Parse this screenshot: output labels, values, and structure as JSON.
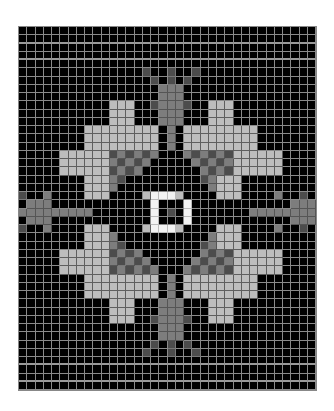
{
  "chart_data": {
    "type": "heatmap",
    "title": "",
    "columns": 36,
    "rows": 44,
    "legend": {
      ".": {
        "name": "black",
        "color": "#000000"
      },
      "L": {
        "name": "light gray",
        "color": "#bdbdbd"
      },
      "M": {
        "name": "mid gray",
        "color": "#7d7d7d"
      },
      "D": {
        "name": "dark gray",
        "color": "#4c4c4c"
      },
      "W": {
        "name": "white",
        "color": "#f2f2f2"
      }
    },
    "dashed_rows": [
      1,
      3,
      40,
      42
    ],
    "grid": [
      "....................................",
      "....................................",
      "....................................",
      "....................................",
      "....................................",
      "...............D..D..D..............",
      "................D.D.D...............",
      ".................MMM................",
      ".................MMM................",
      "...........LLL..DMMMD..LLL..........",
      "...........LLL...MMM...LLL..........",
      "...........LLL...MMM...LLL..........",
      "........LLLLLLLLL.M.LLLLLLLLL.......",
      "........LLLLLLLLL.M.LLLLLLLLL.......",
      "........LLLLLLLLL.M.LLLLLLLLL.......",
      ".....LLLLLLDMDMDM...MDMDMDLLLLLL....",
      ".....LLLLLLMDMDM.....MDMDMLLLLLL....",
      ".....LLLLLLDMDM.......MDMDLLLLLL....",
      "........LLLMD.........DMLLL.........",
      "........LLLM...........MLLL.........",
      "D..M....LLL....LWWWL....LLL....M..D",
      ".MMM............W...W............MMM",
      "MMMMMMMMM.......W.D.W.......MMMMMMMMM",
      ".MMM............W...W............MMM",
      "D..M....LLL....LWWWL....LLL....M..D",
      "........LLLM...........MLLL.........",
      "........LLLMD.........DMLLL.........",
      ".....LLLLLLDMDM.......MDMDLLLLLL....",
      ".....LLLLLLMDMDM.....MDMDMLLLLLL....",
      ".....LLLLLLDMDMDM...MDMDMDLLLLLL....",
      "........LLLLLLLLL.M.LLLLLLLLL.......",
      "........LLLLLLLLL.M.LLLLLLLLL.......",
      "........LLLLLLLLL.M.LLLLLLLLL.......",
      "...........LLL...MMM...LLL..........",
      "...........LLL...MMM...LLL..........",
      "...........LLL..DMMMD..LLL..........",
      ".................MMM................",
      ".................MMM................",
      "................D.D.D...............",
      "...............D..D..D..............",
      "....................................",
      "....................................",
      "....................................",
      "...................................."
    ]
  }
}
